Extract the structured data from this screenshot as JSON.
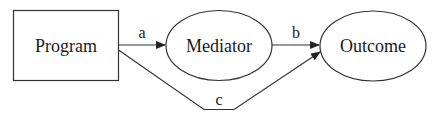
{
  "diagram": {
    "type": "mediation-path-diagram",
    "nodes": [
      {
        "id": "program",
        "label": "Program",
        "shape": "rectangle"
      },
      {
        "id": "mediator",
        "label": "Mediator",
        "shape": "ellipse"
      },
      {
        "id": "outcome",
        "label": "Outcome",
        "shape": "ellipse"
      }
    ],
    "edges": [
      {
        "from": "program",
        "to": "mediator",
        "label": "a"
      },
      {
        "from": "mediator",
        "to": "outcome",
        "label": "b"
      },
      {
        "from": "program",
        "to": "outcome",
        "label": "c"
      }
    ],
    "colors": {
      "stroke": "#333333",
      "text": "#1a1a1a",
      "background": "#ffffff"
    }
  }
}
